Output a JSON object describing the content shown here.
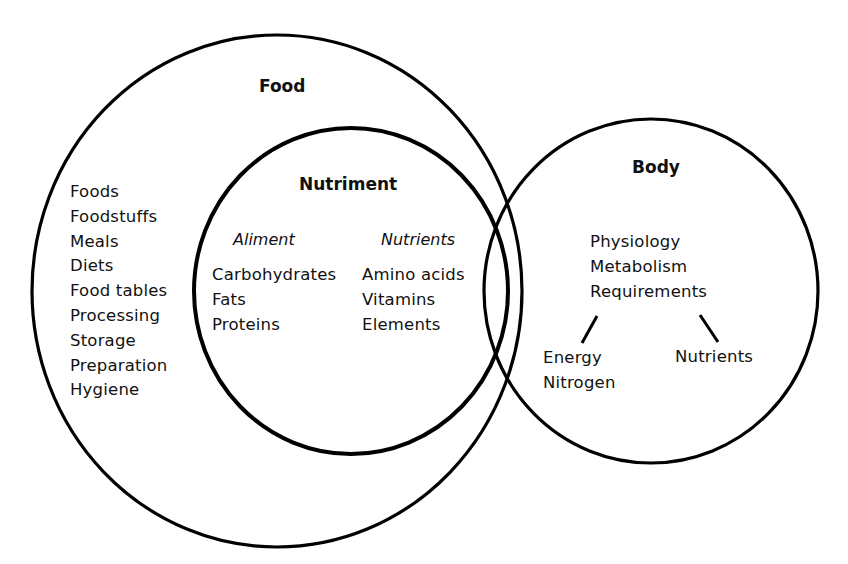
{
  "diagram": {
    "type": "venn",
    "colors": {
      "stroke": "#000000",
      "text": "#111111",
      "background": "#ffffff"
    },
    "circles": {
      "food": {
        "title": "Food",
        "items": [
          "Foods",
          "Foodstuffs",
          "Meals",
          "Diets",
          "Food tables",
          "Processing",
          "Storage",
          "Preparation",
          "Hygiene"
        ]
      },
      "nutriment": {
        "title": "Nutriment",
        "columns": [
          {
            "heading": "Aliment",
            "items": [
              "Carbohydrates",
              "Fats",
              "Proteins"
            ]
          },
          {
            "heading": "Nutrients",
            "items": [
              "Amino acids",
              "Vitamins",
              "Elements"
            ]
          }
        ]
      },
      "body": {
        "title": "Body",
        "items": [
          "Physiology",
          "Metabolism",
          "Requirements"
        ],
        "branches": {
          "left": [
            "Energy",
            "Nitrogen"
          ],
          "right": [
            "Nutrients"
          ]
        }
      }
    }
  }
}
